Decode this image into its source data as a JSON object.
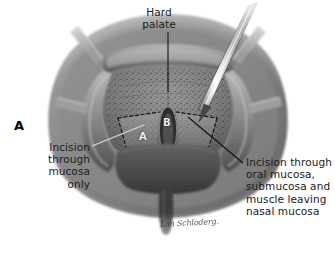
{
  "figure": {
    "panel_letter": "A",
    "background_color": "#ffffff",
    "ink_color": "#1a1a1a"
  },
  "labels": {
    "hard_palate": "Hard\npalate",
    "incision_left": "Incision\nthrough\nmucosa\nonly",
    "incision_right": "Incision through\noral mucosa,\nsubmucosa and\nmuscle leaving\nnasal mucosa"
  },
  "flap_markers": {
    "flap_a": "A",
    "flap_b": "B"
  },
  "signature": {
    "text": "Lan Schloderg."
  },
  "anatomy": {
    "parts": [
      "hard palate",
      "alveolar ridge",
      "soft palate",
      "uvula",
      "cleft",
      "nasal mucosa",
      "oral mucosa"
    ],
    "instruments": [
      "scalpel",
      "retractor"
    ]
  }
}
